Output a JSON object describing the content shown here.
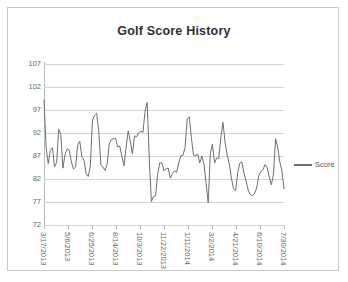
{
  "chart": {
    "title": "Golf Score History",
    "legend_label": "Score",
    "line_color": "#6f6f6f",
    "grid_color": "#d4d4d4",
    "axis_color": "#b9b9b9",
    "text_color": "#666666"
  },
  "chart_data": {
    "type": "line",
    "title": "Golf Score History",
    "xlabel": "",
    "ylabel": "",
    "ylim": [
      72,
      107
    ],
    "ytick_step": 5,
    "yticks": [
      72,
      77,
      82,
      87,
      92,
      97,
      102,
      107
    ],
    "grid": "horizontal",
    "legend_position": "right",
    "xtick_labels": [
      "3/17/2013",
      "5/6/2013",
      "6/25/2013",
      "8/14/2013",
      "10/3/2013",
      "11/22/2013",
      "1/11/2014",
      "3/2/2014",
      "4/21/2014",
      "6/10/2014",
      "7/30/2014"
    ],
    "xtick_index": [
      0,
      12,
      24,
      36,
      48,
      60,
      72,
      84,
      96,
      108,
      120
    ],
    "x_start_date": "3/17/2013",
    "x_end_date": "7/30/2014",
    "series": [
      {
        "name": "Score",
        "values": [
          98,
          84,
          88,
          84,
          94,
          85,
          88,
          88,
          84,
          89,
          88,
          84,
          84,
          97,
          97,
          84,
          84,
          89,
          89,
          90,
          89,
          85,
          93,
          88,
          92,
          94,
          91,
          100,
          78,
          78,
          85,
          84,
          83,
          83,
          84,
          85,
          86,
          90,
          96,
          88,
          88,
          86,
          86,
          75,
          92,
          85,
          88,
          95,
          87,
          84,
          80,
          82,
          87,
          80,
          78,
          78,
          82,
          84,
          84,
          83,
          81,
          94,
          84,
          80
        ]
      }
    ],
    "point_count": 115,
    "min_value": 75,
    "max_value": 100
  }
}
